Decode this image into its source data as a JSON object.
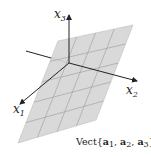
{
  "diagram": {
    "axes": [
      {
        "name": "x",
        "sub": "1"
      },
      {
        "name": "x",
        "sub": "2"
      },
      {
        "name": "x",
        "sub": "3"
      }
    ],
    "plane_label": {
      "prefix": "Vect",
      "open": "{",
      "vectors": [
        {
          "name": "a",
          "sub": "1"
        },
        {
          "name": "a",
          "sub": "2"
        },
        {
          "name": "a",
          "sub": "3"
        }
      ],
      "sep": ", ",
      "close": "}"
    },
    "colors": {
      "plane_fill": "#d6d6d6",
      "grid_line": "#9a9a9a",
      "axis": "#222222"
    },
    "grid_divisions": {
      "u": 4,
      "v": 5
    }
  }
}
